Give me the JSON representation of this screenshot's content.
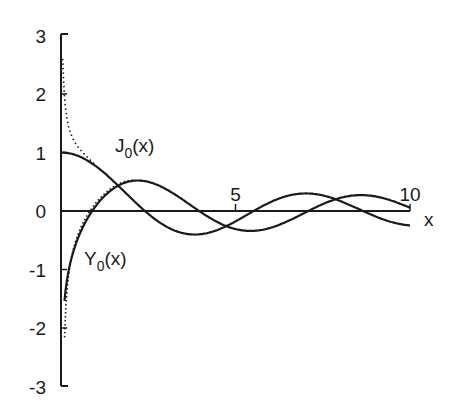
{
  "chart_data": {
    "type": "line",
    "title": "",
    "xlabel": "x",
    "ylabel": "",
    "xlim": [
      0,
      10
    ],
    "ylim": [
      -3,
      3
    ],
    "grid": false,
    "legend": "none (curves labeled inline)",
    "x_ticks": [
      5,
      10
    ],
    "x_tick_labels": [
      "5",
      "10"
    ],
    "y_ticks": [
      3,
      2,
      1,
      0,
      -1,
      -2,
      -3
    ],
    "y_tick_labels": [
      "3",
      "2",
      "1",
      "0",
      "-1",
      "-2",
      "-3"
    ],
    "series": [
      {
        "name": "J0(x)",
        "label_main": "J",
        "label_sub": "0",
        "label_arg": "(x)",
        "x": [
          0,
          0.5,
          1,
          1.5,
          2,
          2.5,
          3,
          3.5,
          4,
          4.5,
          5,
          5.5,
          6,
          6.5,
          7,
          7.5,
          8,
          8.5,
          9,
          9.5,
          10
        ],
        "values": [
          1.0,
          0.938,
          0.765,
          0.512,
          0.224,
          -0.048,
          -0.26,
          -0.38,
          -0.397,
          -0.321,
          -0.178,
          -0.007,
          0.151,
          0.26,
          0.3,
          0.266,
          0.172,
          0.042,
          -0.09,
          -0.194,
          -0.246
        ]
      },
      {
        "name": "Y0(x)",
        "label_main": "Y",
        "label_sub": "0",
        "label_arg": "(x)",
        "x": [
          0.1,
          0.2,
          0.3,
          0.5,
          0.75,
          1,
          1.5,
          2,
          2.5,
          3,
          3.5,
          4,
          4.5,
          5,
          5.5,
          6,
          6.5,
          7,
          7.5,
          8,
          8.5,
          9,
          9.5,
          10
        ],
        "values": [
          -1.534,
          -1.081,
          -0.807,
          -0.445,
          -0.138,
          0.088,
          0.382,
          0.51,
          0.498,
          0.377,
          0.189,
          -0.017,
          -0.195,
          -0.309,
          -0.339,
          -0.288,
          -0.173,
          -0.026,
          0.118,
          0.223,
          0.266,
          0.25,
          0.171,
          0.056
        ]
      },
      {
        "name": "asymptotic approximation (dotted)",
        "style": "dotted",
        "description": "Dotted curves near x→0: a rising branch above J0 approaching the y-axis near y≈2.6, and a descending branch along Y0 toward y≈-2.4"
      }
    ],
    "annotations": [
      {
        "text": "J0(x)",
        "x": 1.7,
        "y": 0.85
      },
      {
        "text": "Y0(x)",
        "x": 1.7,
        "y": -0.95
      }
    ]
  }
}
